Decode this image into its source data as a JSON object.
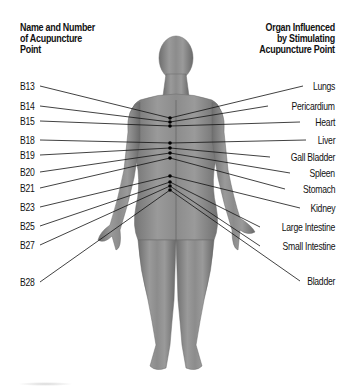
{
  "header": {
    "left_title_lines": [
      "Name and Number",
      "of Acupuncture",
      "Point"
    ],
    "right_title_lines": [
      "Organ Influenced",
      "by Stimulating",
      "Acupuncture Point"
    ]
  },
  "points": [
    {
      "id": "B13",
      "organ": "Lungs"
    },
    {
      "id": "B14",
      "organ": "Pericardium"
    },
    {
      "id": "B15",
      "organ": "Heart"
    },
    {
      "id": "B18",
      "organ": "Liver"
    },
    {
      "id": "B19",
      "organ": "Gall Bladder"
    },
    {
      "id": "B20",
      "organ": "Spleen"
    },
    {
      "id": "B21",
      "organ": "Stomach"
    },
    {
      "id": "B23",
      "organ": "Kidney"
    },
    {
      "id": "B25",
      "organ": "Large Intestine"
    },
    {
      "id": "B27",
      "organ": "Small Intestine"
    },
    {
      "id": "B28",
      "organ": "Bladder"
    }
  ],
  "colors": {
    "skin": "#8a8a8a",
    "line": "#111111",
    "dot": "#000000"
  }
}
